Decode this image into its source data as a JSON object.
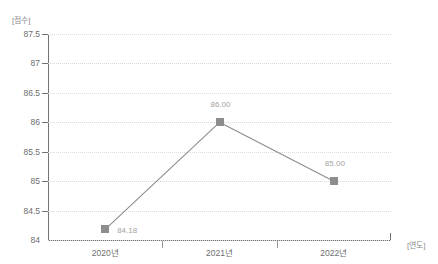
{
  "chart_data": {
    "type": "line",
    "title": "",
    "xlabel": "[연도]",
    "ylabel": "[점수]",
    "categories": [
      "2020년",
      "2021년",
      "2022년"
    ],
    "values": [
      84.18,
      86.0,
      85.0
    ],
    "point_labels": [
      "84.18",
      "86.00",
      "85.00"
    ],
    "ylim": [
      84,
      87.5
    ],
    "ytick_labels": [
      "87.5",
      "87",
      "86.5",
      "86",
      "85.5",
      "85",
      "84.5",
      "84"
    ],
    "ytick_values": [
      87.5,
      87,
      86.5,
      86,
      85.5,
      85,
      84.5,
      84
    ],
    "grid": true,
    "legend": "none",
    "series_color": "#8d8d8d",
    "grid_color": "#d8d8d8",
    "axis_color": "#737373",
    "label_color": "#6e6e6e",
    "point_label_color": "#a3a3a3"
  }
}
